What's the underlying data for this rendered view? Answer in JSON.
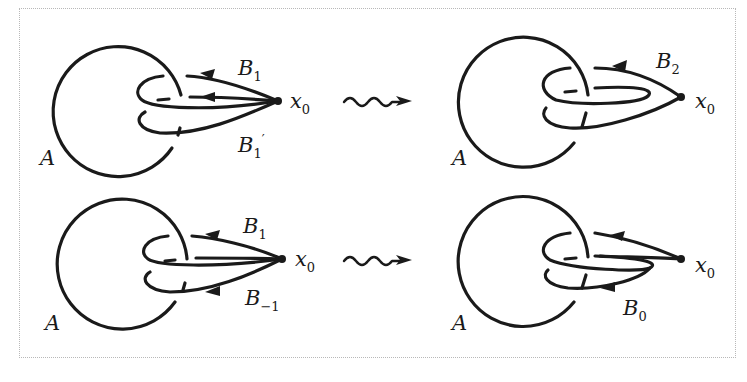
{
  "figure": {
    "panels": [
      {
        "id": "top-left",
        "labels": {
          "circle": "A",
          "basepoint": "x",
          "basepoint_sub": "0",
          "loop_upper": "B",
          "loop_upper_sub": "1",
          "loop_lower": "B",
          "loop_lower_sub": "1",
          "loop_lower_prime": "′"
        }
      },
      {
        "id": "top-right",
        "labels": {
          "circle": "A",
          "basepoint": "x",
          "basepoint_sub": "0",
          "loop": "B",
          "loop_sub": "2"
        }
      },
      {
        "id": "bottom-left",
        "labels": {
          "circle": "A",
          "basepoint": "x",
          "basepoint_sub": "0",
          "loop_upper": "B",
          "loop_upper_sub": "1",
          "loop_lower": "B",
          "loop_lower_sub": "−1"
        }
      },
      {
        "id": "bottom-right",
        "labels": {
          "circle": "A",
          "basepoint": "x",
          "basepoint_sub": "0",
          "loop": "B",
          "loop_sub": "0"
        }
      }
    ],
    "transitions": [
      "squiggly-arrow-top",
      "squiggly-arrow-bottom"
    ],
    "colors": {
      "stroke": "#1a1a1a",
      "border": "#b8b8b8",
      "background": "#ffffff"
    }
  }
}
